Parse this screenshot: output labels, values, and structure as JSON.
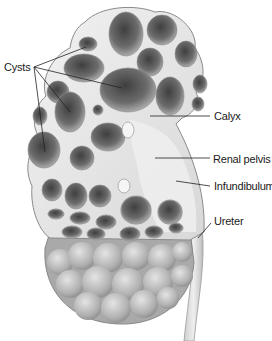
{
  "diagram": {
    "labels": [
      {
        "id": "cysts",
        "text": "Cysts",
        "x": 4,
        "y": 61
      },
      {
        "id": "calyx",
        "text": "Calyx",
        "x": 214,
        "y": 110
      },
      {
        "id": "renal-pelvis",
        "text": "Renal pelvis",
        "x": 213,
        "y": 153
      },
      {
        "id": "infundibulum",
        "text": "Infundibulum",
        "x": 214,
        "y": 180
      },
      {
        "id": "ureter",
        "text": "Ureter",
        "x": 214,
        "y": 215
      }
    ],
    "leader_lines": {
      "cysts": [
        [
          34,
          67,
          86,
          47
        ],
        [
          34,
          67,
          122,
          88
        ],
        [
          34,
          67,
          70,
          112
        ],
        [
          34,
          67,
          45,
          152
        ]
      ],
      "calyx": [
        [
          150,
          116,
          210,
          116
        ]
      ],
      "renal-pelvis": [
        [
          155,
          158,
          210,
          158
        ]
      ],
      "infundibulum": [
        [
          176,
          181,
          210,
          186
        ]
      ],
      "ureter": [
        [
          198,
          238,
          211,
          223
        ]
      ]
    },
    "colors": {
      "tissue": "#e9e9e9",
      "tissue_edge": "#8a8a8a",
      "cyst_dark": "#4a4a4a",
      "cyst_light": "#bdbdbd",
      "leader_line": "#222222",
      "label_text": "#1a1a1a"
    }
  }
}
